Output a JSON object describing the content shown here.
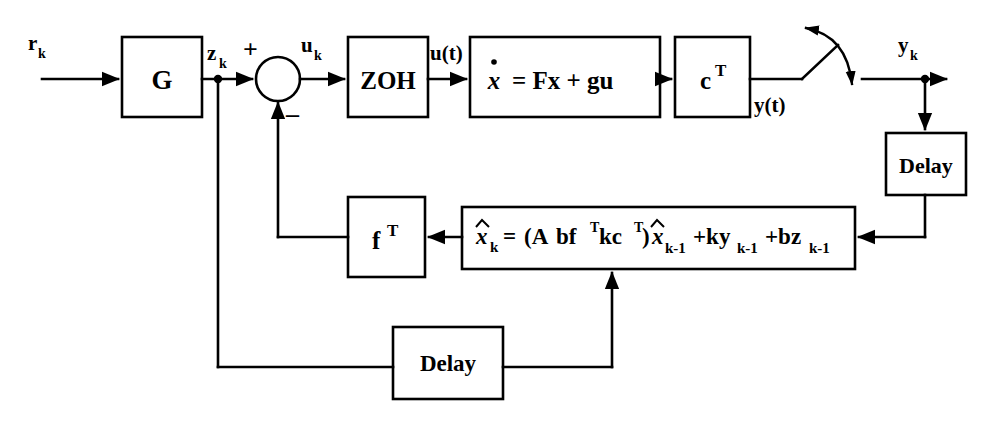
{
  "diagram": {
    "stroke_color": "#000000",
    "background_color": "#ffffff",
    "blocks": [
      {
        "id": "G",
        "label": "G",
        "x": 122,
        "y": 37,
        "w": 80,
        "h": 80
      },
      {
        "id": "ZOH",
        "label": "ZOH",
        "x": 348,
        "y": 37,
        "w": 80,
        "h": 80
      },
      {
        "id": "plant",
        "label": "x = Fx + gu",
        "x": 470,
        "y": 37,
        "w": 190,
        "h": 80
      },
      {
        "id": "cT",
        "label": "c",
        "label_sup": "T",
        "x": 675,
        "y": 37,
        "w": 75,
        "h": 80
      },
      {
        "id": "delay_y",
        "label": "Delay",
        "x": 886,
        "y": 133,
        "w": 80,
        "h": 62
      },
      {
        "id": "fT",
        "label": "f",
        "label_sup": "T",
        "x": 348,
        "y": 197,
        "w": 77,
        "h": 80
      },
      {
        "id": "observer",
        "label": "x",
        "x": 462,
        "y": 207,
        "w": 393,
        "h": 62
      },
      {
        "id": "delay_z",
        "label": "Delay",
        "x": 393,
        "y": 327,
        "w": 110,
        "h": 72
      }
    ],
    "block_text": {
      "G": "G",
      "ZOH": "ZOH",
      "plant_state_eq": "x = Fx + gu",
      "plant_xdot": "x",
      "plant_rhs": "= Fx + gu",
      "cT_base": "c",
      "cT_sup": "T",
      "fT_base": "f",
      "fT_sup": "T",
      "delay_right": "Delay",
      "delay_bottom": "Delay"
    },
    "observer_equation": {
      "lhs_base": "x",
      "lhs_sub": "k",
      "equals": "=",
      "matrix_open": "(A",
      "term_bf": "bf",
      "term_bf_sup": "T",
      "term_kc": "kc",
      "term_kc_sup": "T",
      "matrix_close": ")",
      "state_base": "x",
      "state_sub": "k-1",
      "plus_ky_base": "+ky",
      "plus_ky_sub": "k-1",
      "plus_bz_base": "+bz",
      "plus_bz_sub": "k-1",
      "full": "x̂k = (A-bf T-kc T)x̂k-1 +kyk-1 +bzk-1"
    },
    "signals": [
      {
        "id": "r",
        "base": "r",
        "sub": "k",
        "x": 28,
        "y": 45
      },
      {
        "id": "z",
        "base": "z",
        "sub": "k",
        "x": 207,
        "y": 52
      },
      {
        "id": "u_k",
        "base": "u",
        "sub": "k",
        "x": 301,
        "y": 45
      },
      {
        "id": "u_t",
        "base": "u(t)",
        "sub": "",
        "x": 432,
        "y": 52
      },
      {
        "id": "y_t",
        "base": "y(t)",
        "sub": "",
        "x": 756,
        "y": 104
      },
      {
        "id": "y_k",
        "base": "y",
        "sub": "k",
        "x": 898,
        "y": 45
      }
    ],
    "summing_junction": {
      "cx": 278,
      "cy": 79,
      "r": 22,
      "plus_sign": "+",
      "plus_x": 250,
      "plus_y": 50,
      "minus_sign": "–",
      "minus_x": 290,
      "minus_y": 117
    },
    "sampler": {
      "label": "sampler-switch",
      "pivot_x": 800,
      "pivot_y": 79,
      "arm_end_x": 836,
      "arm_end_y": 47
    }
  }
}
